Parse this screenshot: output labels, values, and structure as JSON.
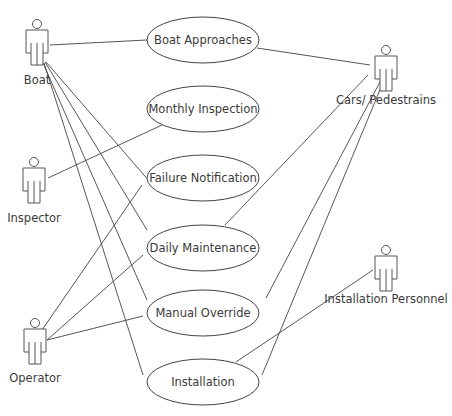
{
  "diagram": {
    "type": "use-case",
    "actors": [
      {
        "id": "boat",
        "label": "Boat"
      },
      {
        "id": "inspector",
        "label": "Inspector"
      },
      {
        "id": "operator",
        "label": "Operator"
      },
      {
        "id": "cars",
        "label": "Cars/ Pedestrains"
      },
      {
        "id": "personnel",
        "label": "Installation Personnel"
      }
    ],
    "use_cases": [
      {
        "id": "approach",
        "label": "Boat Approaches"
      },
      {
        "id": "monthly",
        "label": "Monthly Inspection"
      },
      {
        "id": "failure",
        "label": "Failure Notification"
      },
      {
        "id": "daily",
        "label": "Daily Maintenance"
      },
      {
        "id": "override",
        "label": "Manual Override"
      },
      {
        "id": "install",
        "label": "Installation"
      }
    ],
    "associations": [
      [
        "boat",
        "approach"
      ],
      [
        "boat",
        "daily"
      ],
      [
        "boat",
        "override"
      ],
      [
        "boat",
        "install"
      ],
      [
        "boat",
        "failure"
      ],
      [
        "inspector",
        "monthly"
      ],
      [
        "operator",
        "failure"
      ],
      [
        "operator",
        "daily"
      ],
      [
        "operator",
        "override"
      ],
      [
        "cars",
        "approach"
      ],
      [
        "cars",
        "daily"
      ],
      [
        "cars",
        "override"
      ],
      [
        "cars",
        "install"
      ],
      [
        "personnel",
        "install"
      ]
    ]
  }
}
